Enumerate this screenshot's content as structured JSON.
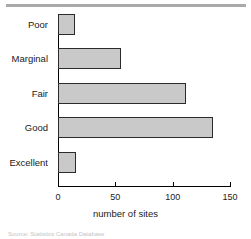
{
  "figure": {
    "top_rule_color": "#a9a9a9",
    "bar_fill_color": "#c9c9c9",
    "bar_border_color": "#2b2b2b",
    "axis_color": "#000000"
  },
  "chart_data": {
    "type": "bar",
    "orientation": "horizontal",
    "title": "",
    "xlabel": "number of sites",
    "ylabel": "",
    "categories": [
      "Poor",
      "Marginal",
      "Fair",
      "Good",
      "Excellent"
    ],
    "values": [
      15,
      55,
      112,
      135,
      16
    ],
    "xlim": [
      0,
      150
    ],
    "xticks": [
      0,
      50,
      100,
      150
    ],
    "xtick_labels": [
      "0",
      "50",
      "100",
      "150"
    ],
    "grid": false,
    "legend": null,
    "series": [
      {
        "name": "number of sites",
        "values": [
          15,
          55,
          112,
          135,
          16
        ]
      }
    ]
  },
  "caption": {
    "text": "Source: Statistics Canada Database"
  }
}
